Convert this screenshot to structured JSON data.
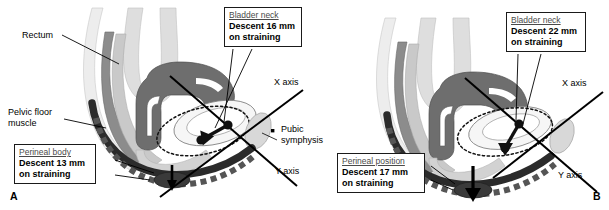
{
  "figure": {
    "type": "medical-anatomical-diagram",
    "panel_letters": [
      "A",
      "B"
    ],
    "colors": {
      "line": "#1a1a1a",
      "box_border": "#1a1a1a",
      "box_fill": "#ffffff",
      "title_text": "#4a4a4a",
      "value_text": "#000000",
      "rectum_fill": "#8c8c8c",
      "bowel_fill": "#6e6e6e",
      "bladder_fill": "#efefef",
      "pelvic_floor_fill": "#2b2b2b",
      "light_tissue": "#e2e2e2",
      "mid_tissue": "#c9c9c9",
      "symphysis_fill": "#d6d6d6"
    }
  },
  "panel_a": {
    "letter": "A",
    "labels": {
      "rectum": "Rectum",
      "pelvic_floor_line1": "Pelvic floor",
      "pelvic_floor_line2": "muscle",
      "x_axis": "X axis",
      "y_axis": "Y axis",
      "pubic_line1": "Pubic",
      "pubic_line2": "symphysis"
    },
    "callouts": [
      {
        "name": "bladder-neck",
        "title": "Bladder neck",
        "line1": "Descent 16 mm",
        "line2": "on straining",
        "measurement_mm": 16,
        "structure": "Bladder neck",
        "condition": "on straining"
      },
      {
        "name": "perineal-body",
        "title": "Perineal body",
        "line1": "Descent 13 mm",
        "line2": "on straining",
        "measurement_mm": 13,
        "structure": "Perineal body",
        "condition": "on straining"
      }
    ]
  },
  "panel_b": {
    "letter": "B",
    "labels": {
      "x_axis": "X axis",
      "y_axis": "Y axis"
    },
    "callouts": [
      {
        "name": "bladder-neck",
        "title": "Bladder neck",
        "line1": "Descent 22 mm",
        "line2": "on straining",
        "measurement_mm": 22,
        "structure": "Bladder neck",
        "condition": "on straining"
      },
      {
        "name": "perineal-position",
        "title": "Perineal position",
        "line1": "Descent 17 mm",
        "line2": "on straining",
        "measurement_mm": 17,
        "structure": "Perineal position",
        "condition": "on straining"
      }
    ]
  }
}
